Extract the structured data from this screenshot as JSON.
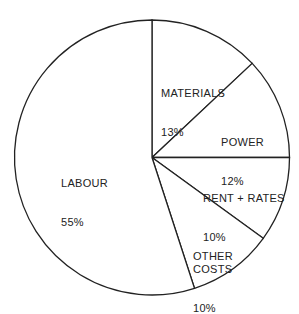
{
  "chart_data": {
    "type": "pie",
    "title": "",
    "start_angle": "12 o'clock, clockwise",
    "categories": [
      "MATERIALS",
      "POWER",
      "RENT + RATES",
      "OTHER COSTS",
      "LABOUR"
    ],
    "values": [
      13,
      12,
      10,
      10,
      55
    ],
    "unit": "%",
    "labels": [
      {
        "name": "MATERIALS",
        "pct": "13%"
      },
      {
        "name": "POWER",
        "pct": "12%"
      },
      {
        "name": "RENT + RATES",
        "pct": "10%"
      },
      {
        "name": "OTHER\nCOSTS",
        "pct": "10%"
      },
      {
        "name": "LABOUR",
        "pct": "55%"
      }
    ],
    "legend": "none (labels inside slices)"
  },
  "colors": {
    "stroke": "#222222",
    "fill": "#ffffff"
  }
}
